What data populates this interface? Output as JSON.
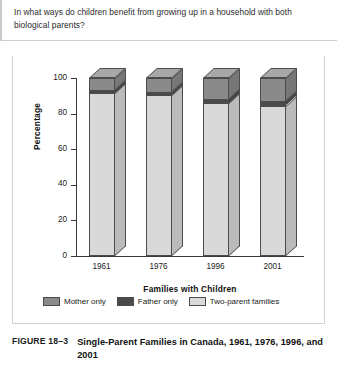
{
  "question": {
    "text": "In what ways do children benefit from growing up in a household with both biological parents?"
  },
  "caption": {
    "figure_label": "FIGURE 18–3",
    "title": "Single-Parent Families in Canada, 1961, 1976, 1996, and 2001"
  },
  "colors": {
    "mother_only": "#8a8a8a",
    "father_only": "#4a4a4a",
    "two_parent": "#d9d9d9",
    "outline": "#4c4c4c",
    "axis": "#3a3a3a"
  },
  "chart_data": {
    "type": "bar",
    "stacked": true,
    "title": "",
    "xlabel": "Families with Children",
    "ylabel": "Percentage",
    "categories": [
      "1961",
      "1976",
      "1996",
      "2001"
    ],
    "ylim": [
      0,
      100
    ],
    "yticks": [
      0,
      20,
      40,
      60,
      80,
      100
    ],
    "grid": false,
    "legend_position": "bottom",
    "series": [
      {
        "name": "Two-parent families",
        "color": "#d9d9d9",
        "values": [
          91.5,
          90.5,
          86.0,
          84.5
        ]
      },
      {
        "name": "Father only",
        "color": "#4a4a4a",
        "values": [
          1.5,
          1.5,
          2.0,
          2.5
        ]
      },
      {
        "name": "Mother only",
        "color": "#8a8a8a",
        "values": [
          7.0,
          8.0,
          12.0,
          13.0
        ]
      }
    ]
  },
  "legend": {
    "items": [
      {
        "label": "Mother only",
        "color": "#8a8a8a"
      },
      {
        "label": "Father only",
        "color": "#4a4a4a"
      },
      {
        "label": "Two-parent families",
        "color": "#d9d9d9"
      }
    ]
  }
}
